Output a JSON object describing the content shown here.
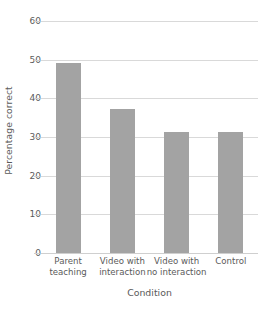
{
  "chart_data": {
    "type": "bar",
    "title": "",
    "xlabel": "Condition",
    "ylabel": "Percentage correct",
    "categories": [
      "Parent teaching",
      "Video with interaction",
      "Video with no interaction",
      "Control"
    ],
    "category_lines": [
      [
        "Parent",
        "teaching"
      ],
      [
        "Video with",
        "interaction"
      ],
      [
        "Video with",
        "no interaction"
      ],
      [
        "Control",
        ""
      ]
    ],
    "values": [
      49.2,
      37.3,
      31.4,
      31.4
    ],
    "ylim": [
      0,
      60
    ],
    "yticks": [
      0,
      10,
      20,
      30,
      40,
      50,
      60
    ],
    "ytick_labels": [
      "0",
      "10",
      "20",
      "30",
      "40",
      "50",
      "60"
    ],
    "grid": "horizontal",
    "legend": "none",
    "bar_color": "#a3a3a3",
    "gridline_color": "#d9d9d9",
    "background_color": "#ffffff",
    "text_color": "#5a5a5a"
  }
}
